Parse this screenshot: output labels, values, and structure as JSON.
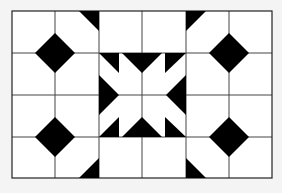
{
  "figure": {
    "grid": {
      "columns": 6,
      "rows": 4
    },
    "colors": {
      "background": "#f4f4f4",
      "cell_fill": "#ffffff",
      "line": "#333333",
      "shape": "#000000"
    }
  }
}
